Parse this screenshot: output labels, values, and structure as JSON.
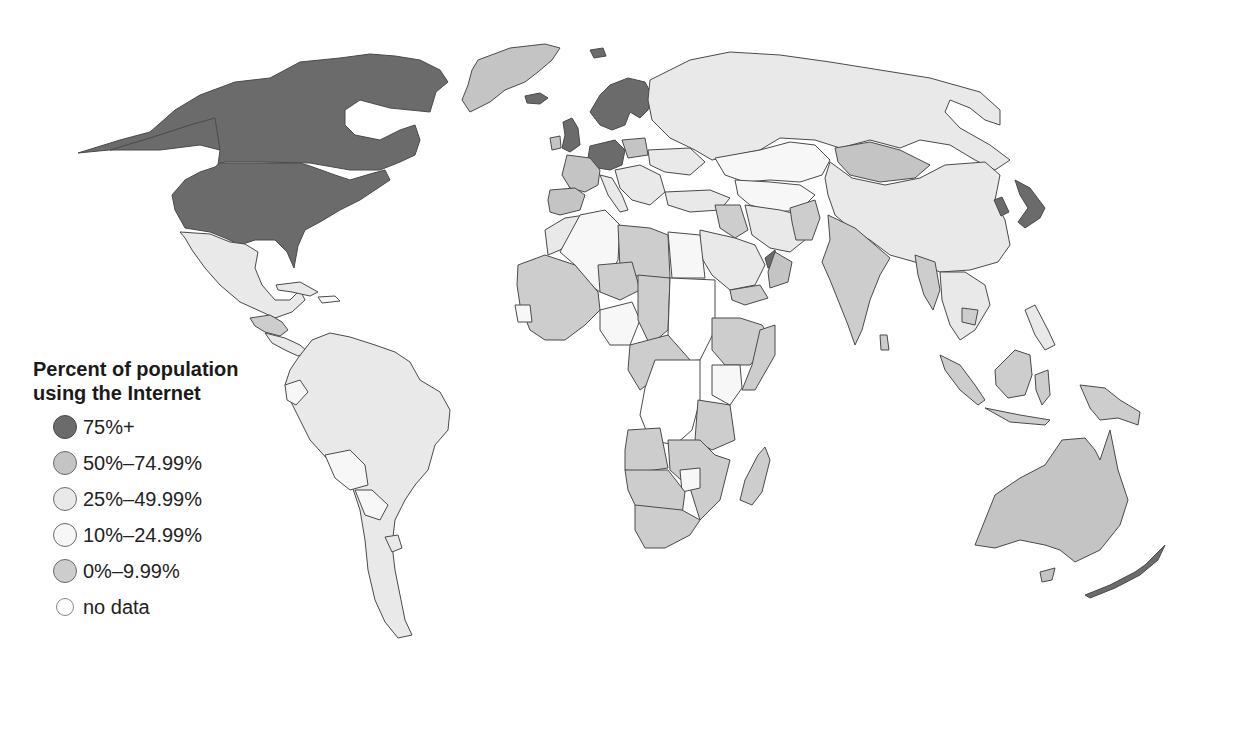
{
  "legend": {
    "title_line1": "Percent of population",
    "title_line2": "using the Internet",
    "items": [
      {
        "label": "75%+",
        "color": "#6b6b6b"
      },
      {
        "label": "50%–74.99%",
        "color": "#c4c4c4"
      },
      {
        "label": "25%–49.99%",
        "color": "#e9e9e9"
      },
      {
        "label": "10%–24.99%",
        "color": "#f7f7f7"
      },
      {
        "label": "0%–9.99%",
        "color": "#cdcdcd"
      },
      {
        "label": "no data",
        "color": "#ffffff"
      }
    ]
  },
  "map": {
    "type": "choropleth",
    "projection": "world, Pacific-cut, Americas left",
    "regions": {
      "75_plus": [
        "Canada",
        "United States",
        "Iceland",
        "United Kingdom",
        "Norway",
        "Sweden",
        "Finland",
        "Denmark",
        "Germany",
        "Netherlands",
        "Austria",
        "Japan",
        "South Korea",
        "United Arab Emirates",
        "New Zealand",
        "Svalbard"
      ],
      "50_74": [
        "Greenland",
        "France",
        "Spain",
        "Poland",
        "Czech Republic",
        "Mongolia",
        "Kazakhstan",
        "Saudi Arabia",
        "Australia"
      ],
      "25_49": [
        "Russia",
        "China",
        "Brazil",
        "Argentina",
        "Mexico",
        "Ukraine",
        "Turkey",
        "Iran",
        "Egypt",
        "Algeria",
        "Chile",
        "Peru",
        "Colombia",
        "Venezuela"
      ],
      "10_24": [
        "Nigeria",
        "Kenya",
        "Zimbabwe",
        "Bolivia",
        "Paraguay",
        "Ecuador",
        "Morocco"
      ],
      "0_9": [
        "India",
        "Pakistan",
        "Afghanistan",
        "Myanmar",
        "Indonesia",
        "Ethiopia",
        "Mali",
        "Niger",
        "Chad",
        "Libya",
        "Angola",
        "Namibia",
        "Botswana",
        "South Africa",
        "Madagascar",
        "Tanzania",
        "Mozambique",
        "Iraq",
        "Yemen",
        "Papua New Guinea",
        "Honduras",
        "Nicaragua"
      ],
      "no_data": [
        "Sudan",
        "Democratic Republic of the Congo"
      ]
    }
  }
}
